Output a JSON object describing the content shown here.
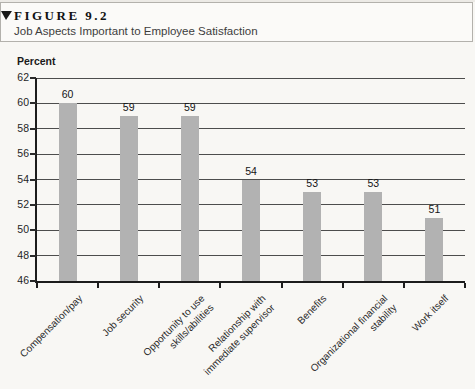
{
  "header": {
    "figure_label": "FIGURE 9.2",
    "title": "Job Aspects Important to Employee Satisfaction"
  },
  "chart_data": {
    "type": "bar",
    "title": "Job Aspects Important to Employee Satisfaction",
    "ylabel": "Percent",
    "xlabel": "",
    "categories": [
      "Compensation/pay",
      "Job security",
      "Opportunity to use\nskills/abilities",
      "Relationship with\nimmediate supervisor",
      "Benefits",
      "Organizational financial\nstability",
      "Work itself"
    ],
    "values": [
      60,
      59,
      59,
      54,
      53,
      53,
      51
    ],
    "ylim": [
      46,
      62
    ],
    "ytick_step": 2,
    "yticks": [
      46,
      48,
      50,
      52,
      54,
      56,
      58,
      60,
      62
    ],
    "grid": true,
    "legend": false,
    "bar_color": "#b2b2b2",
    "gridline_color": "#4d4d4d",
    "axis_color": "#1c1c1c",
    "category_label_rotation_deg": -45
  }
}
